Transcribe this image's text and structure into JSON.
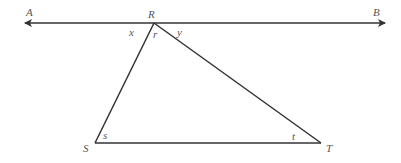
{
  "diagram": {
    "line_labels": {
      "left": "A",
      "right": "B"
    },
    "vertices": {
      "top": "R",
      "bottom_left": "S",
      "bottom_right": "T"
    },
    "angles": {
      "left_of_R": "x",
      "at_R": "r",
      "right_of_R": "y",
      "at_S": "s",
      "at_T": "t"
    },
    "colors": {
      "stroke": "#333333",
      "label": "#555555"
    }
  }
}
